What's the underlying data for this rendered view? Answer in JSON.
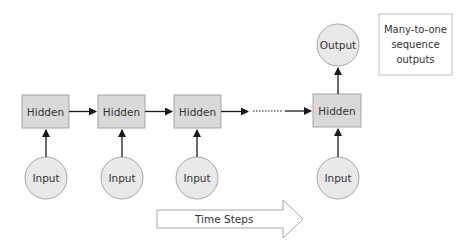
{
  "diagram": {
    "title_box": {
      "lines": [
        "Many-to-one",
        "sequence",
        "outputs"
      ]
    },
    "colors": {
      "node_fill": "#d9d9d9",
      "node_stroke": "#a6a6a6",
      "circle_fill": "#e8e8e8",
      "arrow": "#1a1a1a"
    },
    "hidden_nodes": [
      {
        "label": "Hidden"
      },
      {
        "label": "Hidden"
      },
      {
        "label": "Hidden"
      },
      {
        "label": "Hidden"
      }
    ],
    "input_nodes": [
      {
        "label": "Input"
      },
      {
        "label": "Input"
      },
      {
        "label": "Input"
      },
      {
        "label": "Input"
      }
    ],
    "output_node": {
      "label": "Output"
    },
    "time_arrow": {
      "label": "Time Steps"
    }
  }
}
